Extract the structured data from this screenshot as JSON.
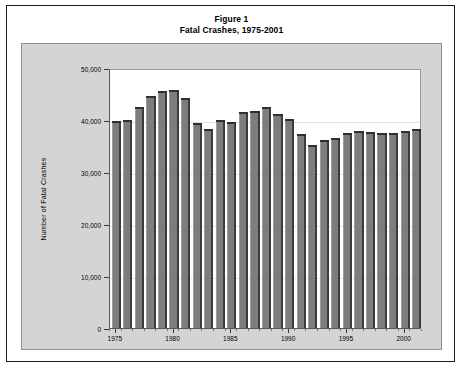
{
  "figure": {
    "title_line1": "Figure 1",
    "title_line2": "Fatal Crashes, 1975-2001"
  },
  "chart_data": {
    "type": "bar",
    "title": "Fatal Crashes, 1975-2001",
    "xlabel": "",
    "ylabel": "Number of Fatal Crashes",
    "ylim": [
      0,
      50000
    ],
    "ytick_values": [
      0,
      10000,
      20000,
      30000,
      40000,
      50000
    ],
    "ytick_labels": [
      "0",
      "10,000",
      "20,000",
      "30,000",
      "40,000",
      "50,000"
    ],
    "xtick_labels": [
      "1975",
      "1980",
      "1985",
      "1990",
      "1995",
      "2000"
    ],
    "xtick_categories": [
      "1975",
      "1980",
      "1985",
      "1990",
      "1995",
      "2000"
    ],
    "grid": true,
    "legend": false,
    "categories": [
      "1975",
      "1976",
      "1977",
      "1978",
      "1979",
      "1980",
      "1981",
      "1982",
      "1983",
      "1984",
      "1985",
      "1986",
      "1987",
      "1988",
      "1989",
      "1990",
      "1991",
      "1992",
      "1993",
      "1994",
      "1995",
      "1996",
      "1997",
      "1998",
      "1999",
      "2000",
      "2001"
    ],
    "values": [
      39400,
      39600,
      42100,
      44300,
      45200,
      45300,
      43900,
      39000,
      37900,
      39600,
      39200,
      41100,
      41400,
      42100,
      40700,
      39800,
      36900,
      34900,
      35800,
      36250,
      37200,
      37500,
      37300,
      37100,
      37100,
      37500,
      37800
    ],
    "colors": {
      "bar_face": "#7d7d7d",
      "bar_side": "#3c3c3c",
      "bar_top": "#2f2f2f",
      "plot_background": "#ffffff",
      "panel_background": "#d4d4d4",
      "gridline": "#e2e2e2",
      "axis": "#3a3a3a",
      "text": "#000000",
      "page_background": "#ffffff",
      "frame_border": "#1a1a1a"
    }
  }
}
